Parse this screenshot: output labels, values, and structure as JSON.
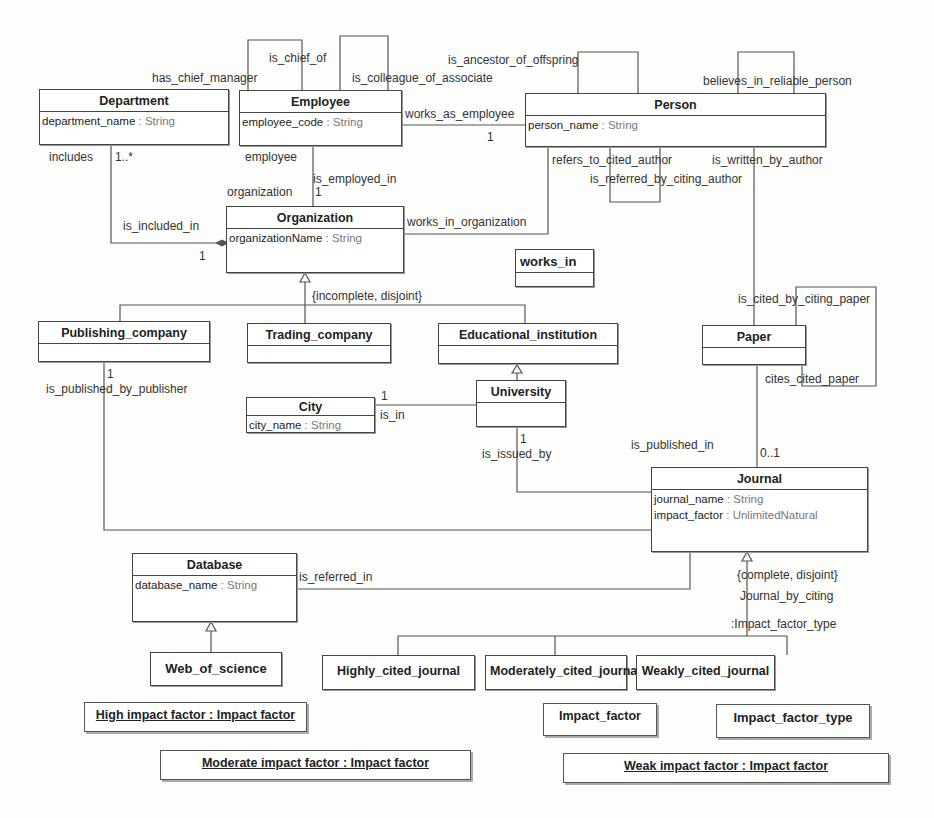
{
  "diagram": {
    "type": "UML class diagram",
    "classes": [
      {
        "id": "department",
        "name": "Department",
        "attributes": [
          {
            "name": "department_name",
            "type": "String"
          }
        ]
      },
      {
        "id": "employee",
        "name": "Employee",
        "attributes": [
          {
            "name": "employee_code",
            "type": "String"
          }
        ]
      },
      {
        "id": "person",
        "name": "Person",
        "attributes": [
          {
            "name": "person_name",
            "type": "String"
          }
        ]
      },
      {
        "id": "organization",
        "name": "Organization",
        "attributes": [
          {
            "name": "organizationName",
            "type": "String"
          }
        ]
      },
      {
        "id": "works_in",
        "name": "works_in",
        "attributes": []
      },
      {
        "id": "publishing_company",
        "name": "Publishing_company",
        "attributes": []
      },
      {
        "id": "trading_company",
        "name": "Trading_company",
        "attributes": []
      },
      {
        "id": "educational_institution",
        "name": "Educational_institution",
        "attributes": []
      },
      {
        "id": "paper",
        "name": "Paper",
        "attributes": []
      },
      {
        "id": "city",
        "name": "City",
        "attributes": [
          {
            "name": "city_name",
            "type": "String"
          }
        ]
      },
      {
        "id": "university",
        "name": "University",
        "attributes": []
      },
      {
        "id": "journal",
        "name": "Journal",
        "attributes": [
          {
            "name": "journal_name",
            "type": "String"
          },
          {
            "name": "impact_factor",
            "type": "UnlimitedNatural"
          }
        ]
      },
      {
        "id": "database",
        "name": "Database",
        "attributes": [
          {
            "name": "database_name",
            "type": "String"
          }
        ]
      },
      {
        "id": "web_of_science",
        "name": "Web_of_science",
        "attributes": []
      },
      {
        "id": "highly_cited_journal",
        "name": "Highly_cited_journal",
        "attributes": []
      },
      {
        "id": "moderately_cited_journal",
        "name": "Moderately_cited_journal",
        "attributes": []
      },
      {
        "id": "weakly_cited_journal",
        "name": "Weakly_cited_journal",
        "attributes": []
      }
    ],
    "standalone_classes": [
      {
        "id": "impact_factor",
        "name": "Impact_factor"
      },
      {
        "id": "impact_factor_type",
        "name": "Impact_factor_type"
      }
    ],
    "instances": [
      {
        "id": "high",
        "label": "High impact factor : Impact factor"
      },
      {
        "id": "moderate",
        "label": "Moderate impact factor : Impact factor"
      },
      {
        "id": "weak",
        "label": "Weak impact factor : Impact factor"
      }
    ],
    "labels": {
      "is_chief_of": "is_chief_of",
      "has_chief_manager": "has_chief_manager",
      "is_colleague_of_associate": "is_colleague_of_associate",
      "is_ancestor_of_offspring": "is_ancestor_of_offspring",
      "believes_in_reliable_person": "believes_in_reliable_person",
      "works_as_employee": "works_as_employee",
      "works_as_employee_mult": "1",
      "includes": "includes",
      "includes_mult": "1..*",
      "employee": "employee",
      "is_employed_in": "is_employed_in",
      "organization": "organization",
      "organization_mult": "1",
      "refers_to_cited_author": "refers_to_cited_author",
      "is_written_by_author": "is_written_by_author",
      "is_referred_by_citing_author": "is_referred_by_citing_author",
      "is_included_in": "is_included_in",
      "is_included_in_mult": "1",
      "works_in_organization": "works_in_organization",
      "incomplete_disjoint": "{incomplete, disjoint}",
      "is_cited_by_citing_paper": "is_cited_by_citing_paper",
      "cites_cited_paper": "cites_cited_paper",
      "publisher_mult": "1",
      "is_published_by_publisher": "is_published_by_publisher",
      "city_mult": "1",
      "is_in": "is_in",
      "university_mult": "1",
      "is_issued_by": "is_issued_by",
      "is_published_in": "is_published_in",
      "journal_mult": "0..1",
      "is_referred_in": "is_referred_in",
      "complete_disjoint": "{complete, disjoint}",
      "journal_by_citing": "Journal_by_citing",
      "impact_factor_type_disc": ":Impact_factor_type"
    }
  }
}
